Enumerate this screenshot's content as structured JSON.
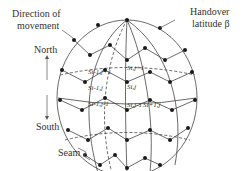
{
  "labels": {
    "direction": "Direction of",
    "movement": "movement",
    "north": "North",
    "south": "South",
    "seam": "Seam",
    "handover": "Handover",
    "latitude": "latitude β"
  },
  "satellites": {
    "s_i_jm1_top": "Si,j+1",
    "s_ij": "Si,j",
    "s_i_jm1": "Si,j-1",
    "s_ip1_jm1": "Si+1,j",
    "s_im1_jp1": "Si-1,j+1",
    "s_im1_j": "Si-1,j",
    "s_im1_jm1": "Si-1,j-1"
  },
  "colors": {
    "line": "#333333",
    "node": "#1a1a1a",
    "background": "#ffffff"
  }
}
